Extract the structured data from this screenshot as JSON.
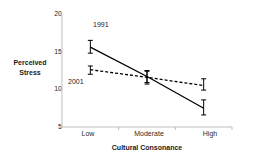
{
  "chart_data": {
    "type": "line",
    "title": "",
    "xlabel": "Cultural Consonance",
    "ylabel": "Perceived Stress",
    "categories": [
      "Low",
      "Moderate",
      "High"
    ],
    "ylim": [
      5,
      20
    ],
    "yticks": [
      5,
      10,
      15,
      20
    ],
    "grid": false,
    "legend_position": "inline-annotation",
    "series": [
      {
        "name": "1991",
        "style": "solid",
        "color": "#000000",
        "values": [
          15.6,
          11.7,
          7.5
        ],
        "err_low": [
          14.8,
          10.9,
          6.6
        ],
        "err_high": [
          16.5,
          12.5,
          8.6
        ]
      },
      {
        "name": "2001",
        "style": "dashed",
        "color": "#000000",
        "values": [
          12.6,
          11.6,
          10.5
        ],
        "err_low": [
          12.0,
          10.7,
          9.9
        ],
        "err_high": [
          13.1,
          12.4,
          11.4
        ]
      }
    ],
    "annotations": [
      {
        "text": "1991",
        "x": 0.42,
        "y": 17.6
      },
      {
        "text": "2001",
        "x": 0.12,
        "y": 10.4
      }
    ]
  },
  "axis": {
    "y_label_line1": "Perceived",
    "y_label_line2": "Stress",
    "x_title": "Cultural Consonance",
    "ytick_labels": [
      "20",
      "15",
      "10",
      "5"
    ],
    "xtick_labels": [
      "Low",
      "Moderate",
      "High"
    ]
  },
  "colors": {
    "axis": "#bfbfbf",
    "data": "#000000",
    "text": "#1a1a1a",
    "background": "#ffffff"
  }
}
